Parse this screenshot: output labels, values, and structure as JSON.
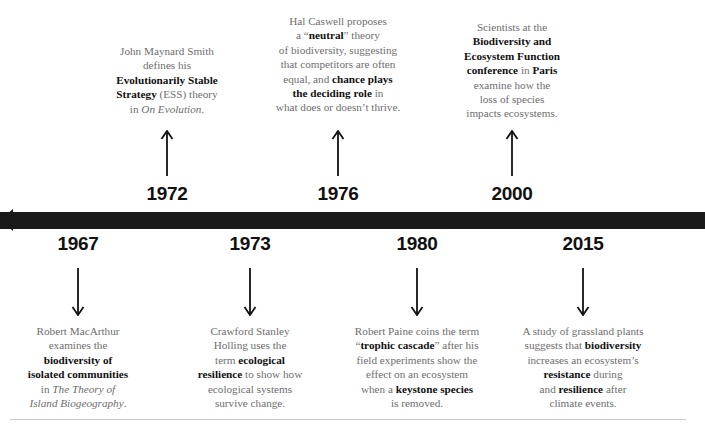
{
  "page": {
    "background_color": "#ffffff",
    "bar_color": "#1a1a1a",
    "body_text_color": "#6e6e6e",
    "emphasis_text_color": "#111111"
  },
  "axis": {
    "direction_icon": "left-arrow-icon",
    "rule_icon": "horizontal-rule"
  },
  "events_above": [
    {
      "year": "1972",
      "arrow_icon": "arrow-up-icon",
      "lines": [
        [
          {
            "t": "John Maynard Smith",
            "b": false
          }
        ],
        [
          {
            "t": "defines his",
            "b": false
          }
        ],
        [
          {
            "t": "Evolutionarily Stable",
            "b": true
          }
        ],
        [
          {
            "t": "Strategy",
            "b": true
          },
          {
            "t": " (ESS) theory",
            "b": false
          }
        ],
        [
          {
            "t": "in ",
            "b": false
          },
          {
            "t": "On Evolution",
            "i": true
          },
          {
            "t": ".",
            "b": false
          }
        ]
      ]
    },
    {
      "year": "1976",
      "arrow_icon": "arrow-up-icon",
      "lines": [
        [
          {
            "t": "Hal Caswell proposes",
            "b": false
          }
        ],
        [
          {
            "t": "a “",
            "b": false
          },
          {
            "t": "neutral",
            "b": true
          },
          {
            "t": "” theory",
            "b": false
          }
        ],
        [
          {
            "t": "of biodiversity, suggesting",
            "b": false
          }
        ],
        [
          {
            "t": "that competitors are often",
            "b": false
          }
        ],
        [
          {
            "t": "equal, and ",
            "b": false
          },
          {
            "t": "chance plays",
            "b": true
          }
        ],
        [
          {
            "t": "the deciding role",
            "b": true
          },
          {
            "t": " in",
            "b": false
          }
        ],
        [
          {
            "t": "what does or doesn’t thrive.",
            "b": false
          }
        ]
      ]
    },
    {
      "year": "2000",
      "arrow_icon": "arrow-up-icon",
      "lines": [
        [
          {
            "t": "Scientists at the",
            "b": false
          }
        ],
        [
          {
            "t": "Biodiversity and",
            "b": true
          }
        ],
        [
          {
            "t": "Ecosystem Function",
            "b": true
          }
        ],
        [
          {
            "t": "conference",
            "b": true
          },
          {
            "t": " in ",
            "b": false
          },
          {
            "t": "Paris",
            "b": true
          }
        ],
        [
          {
            "t": "examine how the",
            "b": false
          }
        ],
        [
          {
            "t": "loss of species",
            "b": false
          }
        ],
        [
          {
            "t": "impacts ecosystems.",
            "b": false
          }
        ]
      ]
    }
  ],
  "events_below": [
    {
      "year": "1967",
      "arrow_icon": "arrow-down-icon",
      "lines": [
        [
          {
            "t": "Robert MacArthur",
            "b": false
          }
        ],
        [
          {
            "t": "examines the",
            "b": false
          }
        ],
        [
          {
            "t": "biodiversity of",
            "b": true
          }
        ],
        [
          {
            "t": "isolated communities",
            "b": true
          }
        ],
        [
          {
            "t": "in ",
            "b": false
          },
          {
            "t": "The Theory of",
            "i": true
          }
        ],
        [
          {
            "t": "Island Biogeography",
            "i": true
          },
          {
            "t": ".",
            "b": false
          }
        ]
      ]
    },
    {
      "year": "1973",
      "arrow_icon": "arrow-down-icon",
      "lines": [
        [
          {
            "t": "Crawford Stanley",
            "b": false
          }
        ],
        [
          {
            "t": "Holling uses the",
            "b": false
          }
        ],
        [
          {
            "t": "term ",
            "b": false
          },
          {
            "t": "ecological",
            "b": true
          }
        ],
        [
          {
            "t": "resilience",
            "b": true
          },
          {
            "t": " to show how",
            "b": false
          }
        ],
        [
          {
            "t": "ecological systems",
            "b": false
          }
        ],
        [
          {
            "t": "survive change.",
            "b": false
          }
        ]
      ]
    },
    {
      "year": "1980",
      "arrow_icon": "arrow-down-icon",
      "lines": [
        [
          {
            "t": "Robert Paine coins the term",
            "b": false
          }
        ],
        [
          {
            "t": "“",
            "b": false
          },
          {
            "t": "trophic cascade",
            "b": true
          },
          {
            "t": "” after his",
            "b": false
          }
        ],
        [
          {
            "t": "field experiments show the",
            "b": false
          }
        ],
        [
          {
            "t": "effect on an ecosystem",
            "b": false
          }
        ],
        [
          {
            "t": "when a ",
            "b": false
          },
          {
            "t": "keystone species",
            "b": true
          }
        ],
        [
          {
            "t": "is removed.",
            "b": false
          }
        ]
      ]
    },
    {
      "year": "2015",
      "arrow_icon": "arrow-down-icon",
      "lines": [
        [
          {
            "t": "A study of grassland plants",
            "b": false
          }
        ],
        [
          {
            "t": "suggests that ",
            "b": false
          },
          {
            "t": "biodiversity",
            "b": true
          }
        ],
        [
          {
            "t": "increases an ecosystem’s",
            "b": false
          }
        ],
        [
          {
            "t": "resistance",
            "b": true
          },
          {
            "t": " during",
            "b": false
          }
        ],
        [
          {
            "t": "and ",
            "b": false
          },
          {
            "t": "resilience",
            "b": true
          },
          {
            "t": " after",
            "b": false
          }
        ],
        [
          {
            "t": "climate events.",
            "b": false
          }
        ]
      ]
    }
  ],
  "layout": {
    "above_columns": [
      {
        "center_x": 167,
        "blurb_top": 44,
        "blurb_width": 160,
        "arrow_top": 130,
        "arrow_height": 46,
        "year_top": 184
      },
      {
        "center_x": 338,
        "blurb_top": 14,
        "blurb_width": 166,
        "arrow_top": 130,
        "arrow_height": 46,
        "year_top": 184
      },
      {
        "center_x": 512,
        "blurb_top": 20,
        "blurb_width": 156,
        "arrow_top": 130,
        "arrow_height": 46,
        "year_top": 184
      }
    ],
    "below_columns": [
      {
        "center_x": 78,
        "year_top": 234,
        "arrow_top": 268,
        "arrow_height": 48,
        "blurb_top": 324,
        "blurb_width": 160
      },
      {
        "center_x": 250,
        "year_top": 234,
        "arrow_top": 268,
        "arrow_height": 48,
        "blurb_top": 324,
        "blurb_width": 160
      },
      {
        "center_x": 417,
        "year_top": 234,
        "arrow_top": 268,
        "arrow_height": 48,
        "blurb_top": 324,
        "blurb_width": 170
      },
      {
        "center_x": 583,
        "year_top": 234,
        "arrow_top": 268,
        "arrow_height": 48,
        "blurb_top": 324,
        "blurb_width": 178
      }
    ]
  }
}
